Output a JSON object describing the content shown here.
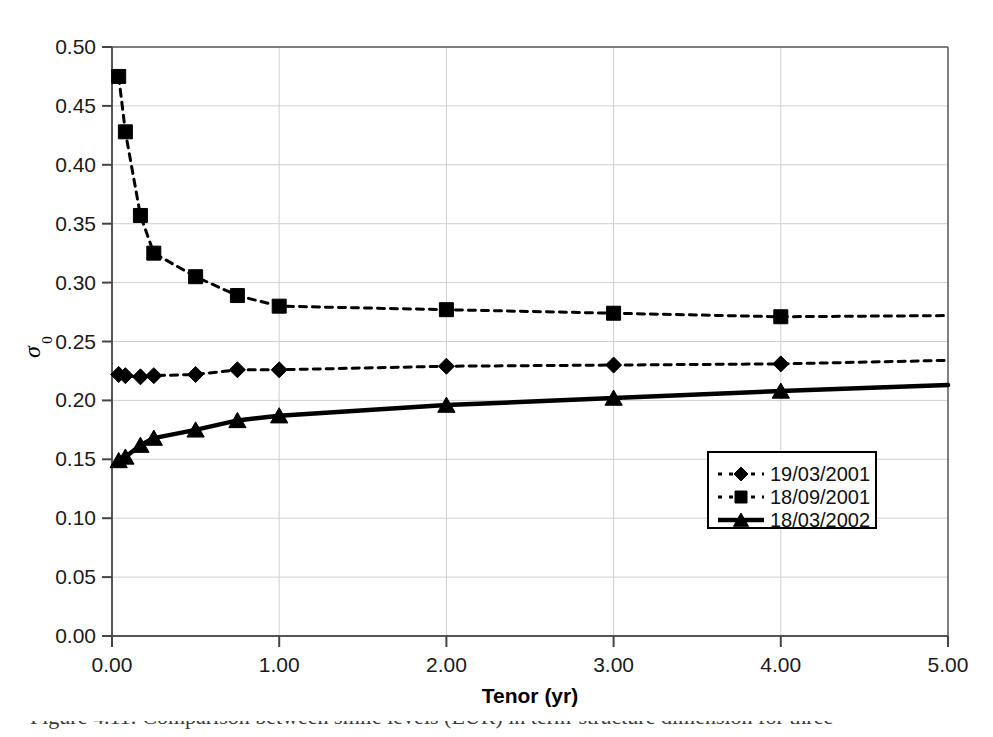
{
  "chart_data": {
    "type": "line",
    "title": "",
    "xlabel": "Tenor (yr)",
    "ylabel": "σ₀",
    "xlim": [
      0.0,
      5.0
    ],
    "ylim": [
      0.0,
      0.5
    ],
    "grid": true,
    "legend_position": "lower right",
    "x_ticks": [
      "0.00",
      "1.00",
      "2.00",
      "3.00",
      "4.00",
      "5.00"
    ],
    "x_tick_values": [
      0.0,
      1.0,
      2.0,
      3.0,
      4.0,
      5.0
    ],
    "y_ticks": [
      "0.00",
      "0.05",
      "0.10",
      "0.15",
      "0.20",
      "0.25",
      "0.30",
      "0.35",
      "0.40",
      "0.45",
      "0.50"
    ],
    "y_tick_values": [
      0.0,
      0.05,
      0.1,
      0.15,
      0.2,
      0.25,
      0.3,
      0.35,
      0.4,
      0.45,
      0.5
    ],
    "series": [
      {
        "name": "19/03/2001",
        "marker": "diamond",
        "linestyle": "dotted",
        "color": "#000000",
        "x": [
          0.04,
          0.08,
          0.17,
          0.25,
          0.5,
          0.75,
          1.0,
          2.0,
          3.0,
          4.0,
          5.0
        ],
        "y": [
          0.222,
          0.221,
          0.22,
          0.221,
          0.222,
          0.226,
          0.226,
          0.229,
          0.23,
          0.231,
          0.234
        ]
      },
      {
        "name": "18/09/2001",
        "marker": "square",
        "linestyle": "dotted",
        "color": "#000000",
        "x": [
          0.04,
          0.08,
          0.17,
          0.25,
          0.5,
          0.75,
          1.0,
          2.0,
          3.0,
          4.0,
          5.0
        ],
        "y": [
          0.475,
          0.428,
          0.357,
          0.325,
          0.305,
          0.289,
          0.28,
          0.277,
          0.274,
          0.271,
          0.272
        ]
      },
      {
        "name": "18/03/2002",
        "marker": "triangle",
        "linestyle": "solid",
        "color": "#000000",
        "x": [
          0.04,
          0.08,
          0.17,
          0.25,
          0.5,
          0.75,
          1.0,
          2.0,
          3.0,
          4.0,
          5.0
        ],
        "y": [
          0.149,
          0.152,
          0.162,
          0.168,
          0.175,
          0.183,
          0.187,
          0.196,
          0.202,
          0.208,
          0.213
        ]
      }
    ]
  },
  "legend": {
    "entries": [
      {
        "label": "19/03/2001"
      },
      {
        "label": "18/09/2001"
      },
      {
        "label": "18/03/2002"
      }
    ]
  },
  "caption": {
    "text": "Figure 4.11: Comparison between smile levels (EUR) in term-structure dimension for three"
  }
}
